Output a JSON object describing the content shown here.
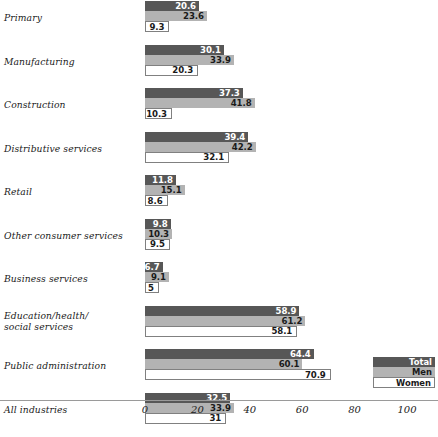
{
  "chart_data": {
    "type": "bar",
    "orientation": "horizontal",
    "title": "",
    "xlabel": "",
    "ylabel": "",
    "xlim": [
      0,
      110
    ],
    "xticks": [
      0,
      20,
      40,
      60,
      80,
      100
    ],
    "xtick_labels": [
      "0",
      "20",
      "40",
      "60",
      "80",
      "100"
    ],
    "grid": false,
    "legend_position": "bottom-right",
    "categories": [
      "Primary",
      "Manufacturing",
      "Construction",
      "Distributive services",
      "Retail",
      "Other consumer services",
      "Business services",
      "Education/health/\nsocial services",
      "Public administration",
      "All industries"
    ],
    "series": [
      {
        "name": "Total",
        "color": "#575757",
        "values": [
          20.6,
          30.1,
          37.3,
          39.4,
          11.8,
          9.8,
          6.7,
          58.9,
          64.4,
          32.5
        ],
        "labels": [
          "20.6",
          "30.1",
          "37.3",
          "39.4",
          "11.8",
          "9.8",
          "6.7",
          "58.9",
          "64.4",
          "32.5"
        ]
      },
      {
        "name": "Men",
        "color": "#b3b3b3",
        "values": [
          23.6,
          33.9,
          41.8,
          42.2,
          15.1,
          10.3,
          9.1,
          61.2,
          60.1,
          33.9
        ],
        "labels": [
          "23.6",
          "33.9",
          "41.8",
          "42.2",
          "15.1",
          "10.3",
          "9.1",
          "61.2",
          "60.1",
          "33.9"
        ]
      },
      {
        "name": "Women",
        "color": "#ffffff",
        "values": [
          9.3,
          20.3,
          10.3,
          32.1,
          8.6,
          9.5,
          5.0,
          58.1,
          70.9,
          31.0
        ],
        "labels": [
          "9.3",
          "20.3",
          "10.3",
          "32.1",
          "8.6",
          "9.5",
          "5",
          "58.1",
          "70.9",
          "31"
        ]
      }
    ]
  },
  "legend": {
    "items": [
      {
        "label": "Total"
      },
      {
        "label": "Men"
      },
      {
        "label": "Women"
      }
    ]
  },
  "axis": {
    "ticks": [
      "0",
      "20",
      "40",
      "60",
      "80",
      "100"
    ]
  },
  "categories_display": [
    {
      "line1": "Primary",
      "line2": ""
    },
    {
      "line1": "Manufacturing",
      "line2": ""
    },
    {
      "line1": "Construction",
      "line2": ""
    },
    {
      "line1": "Distributive services",
      "line2": ""
    },
    {
      "line1": "Retail",
      "line2": ""
    },
    {
      "line1": "Other consumer services",
      "line2": ""
    },
    {
      "line1": "Business services",
      "line2": ""
    },
    {
      "line1": "Education/health/",
      "line2": "social services"
    },
    {
      "line1": "Public administration",
      "line2": ""
    },
    {
      "line1": "All industries",
      "line2": ""
    }
  ]
}
